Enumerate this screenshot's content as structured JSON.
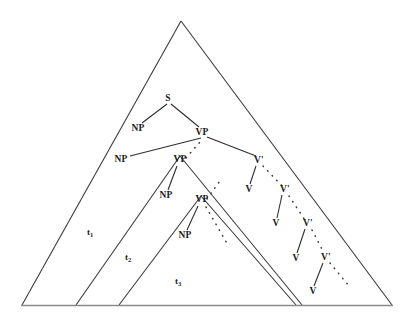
{
  "figure": {
    "stroke_color": "#3b3b3b",
    "baseline_color": "#8a8a8a",
    "background_color": "#ffffff",
    "text_color": "#1a1a1a"
  },
  "nodes": [
    {
      "id": "s",
      "label": "S",
      "x": 168,
      "y": 99
    },
    {
      "id": "np1",
      "label": "NP",
      "x": 138,
      "y": 129
    },
    {
      "id": "vp1",
      "label": "VP",
      "x": 202,
      "y": 133
    },
    {
      "id": "np2",
      "label": "NP",
      "x": 121,
      "y": 160
    },
    {
      "id": "vp2",
      "label": "VP",
      "x": 180,
      "y": 160
    },
    {
      "id": "np3",
      "label": "NP",
      "x": 166,
      "y": 196
    },
    {
      "id": "vp3",
      "label": "VP",
      "x": 202,
      "y": 200
    },
    {
      "id": "np4",
      "label": "NP",
      "x": 185,
      "y": 236
    },
    {
      "id": "vbar1",
      "label": "V'",
      "x": 259,
      "y": 161
    },
    {
      "id": "v1",
      "label": "V",
      "x": 249,
      "y": 190
    },
    {
      "id": "vbar2",
      "label": "V'",
      "x": 285,
      "y": 190
    },
    {
      "id": "v2",
      "label": "V",
      "x": 276,
      "y": 224
    },
    {
      "id": "vbar3",
      "label": "V'",
      "x": 308,
      "y": 224
    },
    {
      "id": "v3",
      "label": "V",
      "x": 296,
      "y": 259
    },
    {
      "id": "vbar4",
      "label": "V'",
      "x": 326,
      "y": 258
    },
    {
      "id": "v4",
      "label": "V",
      "x": 313,
      "y": 292
    }
  ],
  "stage_labels": [
    {
      "id": "t1",
      "base": "t",
      "sub": "1",
      "x": 90,
      "y": 232
    },
    {
      "id": "t2",
      "base": "t",
      "sub": "2",
      "x": 128,
      "y": 257
    },
    {
      "id": "t3",
      "base": "t",
      "sub": "3",
      "x": 178,
      "y": 281
    }
  ],
  "triangles": [
    {
      "id": "outer-triangle",
      "apex_x": 181,
      "apex_y": 21,
      "left_x": 22,
      "right_x": 392,
      "base_y": 305
    },
    {
      "id": "middle-triangle",
      "apex_x": 180,
      "apex_y": 156,
      "left_x": 76,
      "right_x": 302,
      "base_y": 305
    },
    {
      "id": "inner-triangle",
      "apex_x": 201,
      "apex_y": 196,
      "left_x": 119,
      "right_x": 296,
      "base_y": 305
    }
  ],
  "tree_edges": [
    {
      "from": "s",
      "to": "np1"
    },
    {
      "from": "s",
      "to": "vp1"
    },
    {
      "from": "np2",
      "to": "vp1"
    },
    {
      "from": "vp1",
      "to": "vbar1"
    },
    {
      "from": "vbar1",
      "to": "v1"
    },
    {
      "from": "vbar2",
      "to": "v2"
    },
    {
      "from": "vbar3",
      "to": "v3"
    },
    {
      "from": "vbar4",
      "to": "v4"
    },
    {
      "from": "vp2",
      "to": "np3"
    },
    {
      "from": "vp3",
      "to": "np4"
    }
  ],
  "dotted_connectors": [
    {
      "id": "dots-vp1-vp2",
      "from": "vp2",
      "to": "vp1"
    },
    {
      "id": "dots-vp2-vp3",
      "from": "vp3",
      "to": "vp2"
    },
    {
      "id": "dots-vp3-down",
      "from": "np4",
      "to": "vp3"
    },
    {
      "id": "dots-vbar1-vbar2",
      "from": "vbar1",
      "to": "vbar2"
    },
    {
      "id": "dots-vbar2-vbar3",
      "from": "vbar2",
      "to": "vbar3"
    },
    {
      "id": "dots-vbar3-vbar4",
      "from": "vbar3",
      "to": "vbar4"
    },
    {
      "id": "dots-vbar4-end",
      "from": "vbar4",
      "to": "end"
    }
  ]
}
